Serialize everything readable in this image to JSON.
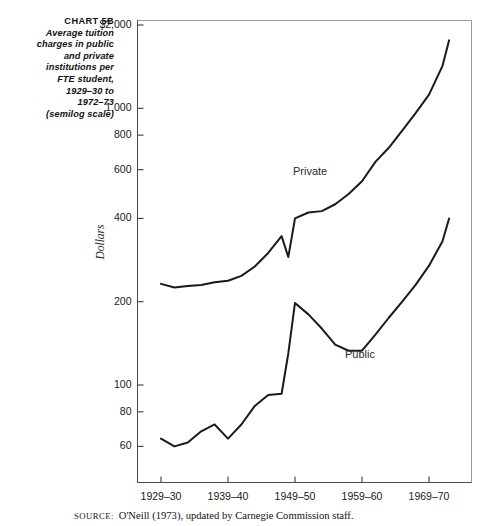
{
  "title": {
    "chart_number": "CHART 5B",
    "lines": [
      "Average tuition",
      "charges in public",
      "and private",
      "institutions per",
      "FTE student,",
      "1929–30 to",
      "1972–73",
      "(semilog scale)"
    ]
  },
  "source": {
    "label": "SOURCE:",
    "text": "O'Neill (1973), updated by Carnegie Commission staff."
  },
  "chart_data": {
    "type": "line",
    "title": "Average tuition charges in public and private institutions per FTE student, 1929–30 to 1972–73 (semilog scale)",
    "xlabel": "",
    "ylabel": "Dollars",
    "scale": "semilog",
    "grid": false,
    "legend_position": "inline-annotations",
    "xlim": [
      1929,
      1973
    ],
    "ylim": [
      50,
      2200
    ],
    "xticks": [
      1929,
      1939,
      1949,
      1959,
      1969
    ],
    "xtick_labels": [
      "1929–30",
      "1939–40",
      "1949–50",
      "1959–60",
      "1969–70"
    ],
    "yticks": [
      2000,
      1000,
      800,
      600,
      400,
      200,
      100,
      80,
      60
    ],
    "ytick_labels": [
      "$2,000",
      "1,000",
      "800",
      "600",
      "400",
      "200",
      "100",
      "80",
      "60"
    ],
    "series": [
      {
        "name": "Private",
        "color": "#1a1a1a",
        "x": [
          1929,
          1931,
          1933,
          1935,
          1937,
          1939,
          1941,
          1943,
          1945,
          1947,
          1948,
          1949,
          1951,
          1953,
          1955,
          1957,
          1959,
          1961,
          1963,
          1965,
          1967,
          1969,
          1971,
          1972
        ],
        "y": [
          232,
          225,
          228,
          230,
          235,
          238,
          248,
          268,
          300,
          345,
          290,
          400,
          420,
          425,
          450,
          490,
          545,
          640,
          720,
          830,
          960,
          1120,
          1420,
          1760
        ]
      },
      {
        "name": "Public",
        "color": "#1a1a1a",
        "x": [
          1929,
          1931,
          1933,
          1935,
          1937,
          1939,
          1941,
          1943,
          1945,
          1947,
          1948,
          1949,
          1951,
          1953,
          1955,
          1957,
          1959,
          1961,
          1963,
          1965,
          1967,
          1969,
          1971,
          1972
        ],
        "y": [
          64,
          60,
          62,
          68,
          72,
          64,
          72,
          84,
          92,
          93,
          130,
          198,
          180,
          160,
          140,
          133,
          133,
          152,
          175,
          200,
          230,
          270,
          330,
          400
        ]
      }
    ],
    "annotations": [
      {
        "text": "Private",
        "x": 1954,
        "y": 600
      },
      {
        "text": "Public",
        "x": 1962,
        "y": 125
      }
    ]
  },
  "axis": {
    "ylabel": "Dollars"
  }
}
